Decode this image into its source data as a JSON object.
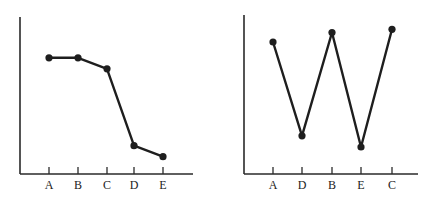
{
  "chart_data": [
    {
      "type": "line",
      "title": "",
      "xlabel": "",
      "ylabel": "",
      "categories": [
        "A",
        "B",
        "C",
        "D",
        "E"
      ],
      "values": [
        74,
        74,
        67,
        18,
        11
      ],
      "ylim": [
        0,
        100
      ],
      "grid": false,
      "legend": null,
      "markers": true
    },
    {
      "type": "line",
      "title": "",
      "xlabel": "",
      "ylabel": "",
      "categories": [
        "A",
        "D",
        "B",
        "E",
        "C"
      ],
      "values": [
        83,
        24,
        89,
        17,
        91
      ],
      "ylim": [
        0,
        100
      ],
      "grid": false,
      "legend": null,
      "markers": true
    }
  ],
  "layout": {
    "charts": [
      {
        "axis_x0": 20,
        "axis_x1": 193,
        "axis_y_top": 17,
        "axis_y0": 174,
        "tick_x": [
          49,
          78,
          107,
          134,
          163
        ]
      },
      {
        "axis_x0": 244,
        "axis_x1": 418,
        "axis_y_top": 15,
        "axis_y0": 174,
        "tick_x": [
          273,
          302,
          332,
          361,
          392
        ]
      }
    ]
  }
}
